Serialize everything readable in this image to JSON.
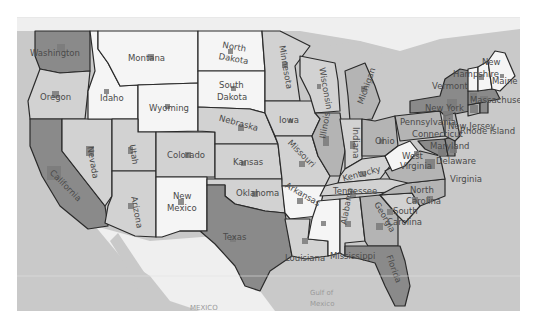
{
  "map": {
    "type": "choropleth",
    "region": "United States",
    "colors": {
      "ocean": "#c9c9c9",
      "land_foreign": "#efefef",
      "tier_1": "#f5f5f5",
      "tier_2": "#d2d2d2",
      "tier_3": "#b4b4b4",
      "tier_4": "#8a8a8a",
      "border": "#2a2a2a",
      "label": "#4a4a4a",
      "marker": "#7a7a7a"
    },
    "water_labels": {
      "mexico": "MEXICO",
      "gulf_line1": "Gulf of",
      "gulf_line2": "Mexico"
    },
    "states": [
      {
        "name": "Washington",
        "label": "Washington",
        "tier": 4
      },
      {
        "name": "Oregon",
        "label": "Oregon",
        "tier": 2
      },
      {
        "name": "California",
        "label": "California",
        "tier": 4
      },
      {
        "name": "Nevada",
        "label": "Nevada",
        "tier": 2
      },
      {
        "name": "Idaho",
        "label": "Idaho",
        "tier": 1
      },
      {
        "name": "Montana",
        "label": "Montana",
        "tier": 1
      },
      {
        "name": "Wyoming",
        "label": "Wyoming",
        "tier": 1
      },
      {
        "name": "Utah",
        "label": "Utah",
        "tier": 2
      },
      {
        "name": "Arizona",
        "label": "Arizona",
        "tier": 2
      },
      {
        "name": "Colorado",
        "label": "Colorado",
        "tier": 2
      },
      {
        "name": "New Mexico",
        "label_line1": "New",
        "label_line2": "Mexico",
        "tier": 1
      },
      {
        "name": "North Dakota",
        "label_line1": "North",
        "label_line2": "Dakota",
        "tier": 1
      },
      {
        "name": "South Dakota",
        "label_line1": "South",
        "label_line2": "Dakota",
        "tier": 1
      },
      {
        "name": "Nebraska",
        "label": "Nebraska",
        "tier": 2
      },
      {
        "name": "Kansas",
        "label": "Kansas",
        "tier": 2
      },
      {
        "name": "Oklahoma",
        "label": "Oklahoma",
        "tier": 2
      },
      {
        "name": "Texas",
        "label": "Texas",
        "tier": 4
      },
      {
        "name": "Minnesota",
        "label": "Minnesota",
        "tier": 2
      },
      {
        "name": "Iowa",
        "label": "Iowa",
        "tier": 2
      },
      {
        "name": "Missouri",
        "label": "Missouri",
        "tier": 2
      },
      {
        "name": "Arkansas",
        "label": "Arkansas",
        "tier": 1
      },
      {
        "name": "Louisiana",
        "label": "Louisiana",
        "tier": 2
      },
      {
        "name": "Wisconsin",
        "label": "Wisconsin",
        "tier": 2
      },
      {
        "name": "Illinois",
        "label": "Illinois",
        "tier": 3
      },
      {
        "name": "Michigan",
        "label": "Michigan",
        "tier": 3
      },
      {
        "name": "Indiana",
        "label": "Indiana",
        "tier": 2
      },
      {
        "name": "Ohio",
        "label": "Ohio",
        "tier": 3
      },
      {
        "name": "Kentucky",
        "label": "Kentucky",
        "tier": 2
      },
      {
        "name": "Tennessee",
        "label": "Tennessee",
        "tier": 2
      },
      {
        "name": "Mississippi",
        "label": "Mississippi",
        "tier": 1
      },
      {
        "name": "Alabama",
        "label": "Alabama",
        "tier": 2
      },
      {
        "name": "Georgia",
        "label": "Georgia",
        "tier": 3
      },
      {
        "name": "Florida",
        "label": "Florida",
        "tier": 4
      },
      {
        "name": "South Carolina",
        "label_line1": "South",
        "label_line2": "Carolina",
        "tier": 2
      },
      {
        "name": "North Carolina",
        "label_line1": "North",
        "label_line2": "Carolina",
        "tier": 3
      },
      {
        "name": "Virginia",
        "label": "Virginia",
        "tier": 3
      },
      {
        "name": "West Virginia",
        "label_line1": "West",
        "label_line2": "Virginia",
        "tier": 1
      },
      {
        "name": "Pennsylvania",
        "label": "Pennsylvania",
        "tier": 3
      },
      {
        "name": "New York",
        "label": "New York",
        "tier": 4
      },
      {
        "name": "Maryland",
        "label": "Maryland",
        "tier": 4
      },
      {
        "name": "Delaware",
        "label": "Delaware",
        "tier": 4
      },
      {
        "name": "New Jersey",
        "label": "New Jersey",
        "tier": 3
      },
      {
        "name": "Connecticut",
        "label": "Connecticut",
        "tier": 3
      },
      {
        "name": "Rhode Island",
        "label": "Rhode Island",
        "tier": 4
      },
      {
        "name": "Massachusetts",
        "label": "Massachuset",
        "tier": 4
      },
      {
        "name": "Vermont",
        "label": "Vermont",
        "tier": 1
      },
      {
        "name": "New Hampshire",
        "label_line1": "New",
        "label_line2": "Hampshire",
        "tier": 1
      },
      {
        "name": "Maine",
        "label": "Maine",
        "tier": 1
      }
    ]
  }
}
